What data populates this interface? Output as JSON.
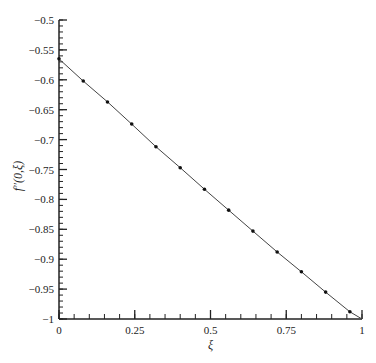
{
  "chart_data": {
    "type": "line",
    "title": "",
    "xlabel": "ξ",
    "ylabel": "f″(0,ξ)",
    "xlim": [
      0,
      1
    ],
    "ylim": [
      -1,
      -0.5
    ],
    "grid": false,
    "legend": null,
    "x_ticks": [
      0,
      0.25,
      0.5,
      0.75,
      1
    ],
    "x_tick_labels": [
      "0",
      "0.25",
      "0.5",
      "0.75",
      "1"
    ],
    "x_minor_step": 0.05,
    "y_ticks": [
      -0.5,
      -0.55,
      -0.6,
      -0.65,
      -0.7,
      -0.75,
      -0.8,
      -0.85,
      -0.9,
      -0.95,
      -1
    ],
    "y_tick_labels": [
      "-0.5",
      "-0.55",
      "-0.6",
      "-0.65",
      "-0.7",
      "-0.75",
      "-0.8",
      "-0.85",
      "-0.9",
      "-0.95",
      "-1"
    ],
    "y_minor_step": 0.01,
    "series": [
      {
        "name": "curve",
        "style": "line",
        "color": "#333333",
        "x": [
          0,
          0.08,
          0.16,
          0.24,
          0.32,
          0.4,
          0.48,
          0.56,
          0.64,
          0.72,
          0.8,
          0.88,
          0.96,
          1.0
        ],
        "y": [
          -0.565,
          -0.602,
          -0.637,
          -0.674,
          -0.712,
          -0.747,
          -0.783,
          -0.818,
          -0.853,
          -0.888,
          -0.921,
          -0.955,
          -0.988,
          -1.0
        ]
      },
      {
        "name": "points",
        "style": "markers",
        "color": "#111111",
        "x": [
          0,
          0.08,
          0.16,
          0.24,
          0.32,
          0.4,
          0.48,
          0.56,
          0.64,
          0.72,
          0.8,
          0.88,
          0.96
        ],
        "y": [
          -0.565,
          -0.602,
          -0.637,
          -0.674,
          -0.712,
          -0.747,
          -0.783,
          -0.818,
          -0.853,
          -0.888,
          -0.921,
          -0.955,
          -0.988
        ]
      }
    ]
  }
}
